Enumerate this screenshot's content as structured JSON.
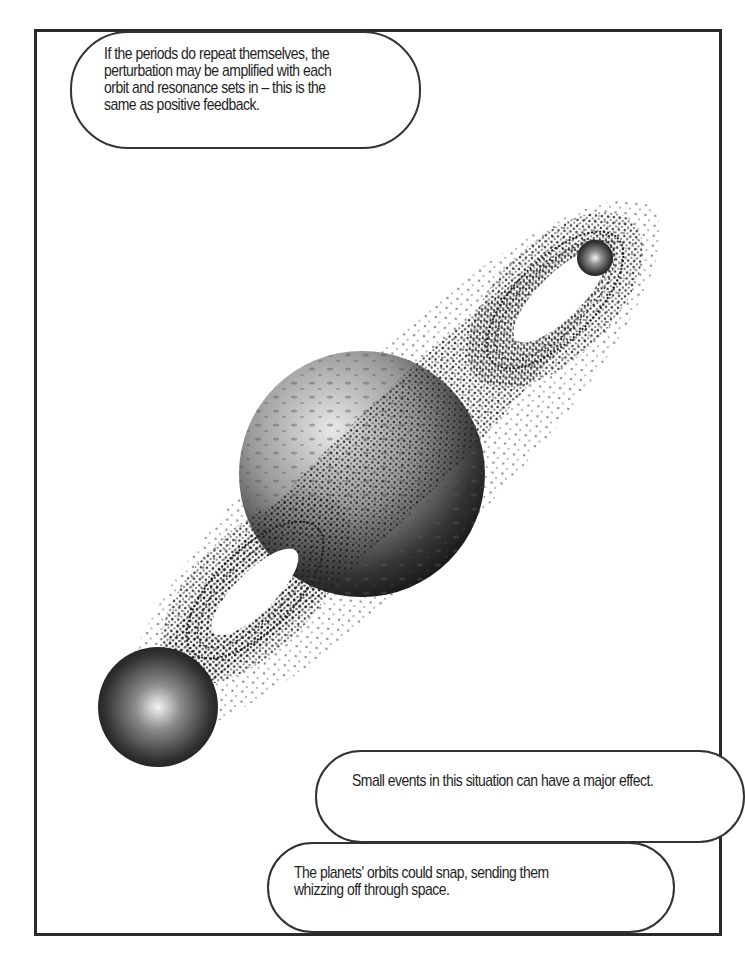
{
  "panel": {
    "captions": [
      {
        "text": "If the periods do repeat themselves, the\nperturbation may be amplified with each\norbit and resonance sets in – this is the\nsame as positive feedback."
      },
      {
        "text": "Small events in this situation can have a major effect."
      },
      {
        "text": "The planets' orbits could snap, sending them\nwhizzing off through space."
      }
    ],
    "illustration": {
      "subject": "central planet with two orbiting bodies and chaotic figure-eight orbit particle clouds",
      "colors": {
        "ink": "#1e1e1e",
        "frame": "#2a2a2a",
        "paper": "#ffffff"
      }
    }
  }
}
